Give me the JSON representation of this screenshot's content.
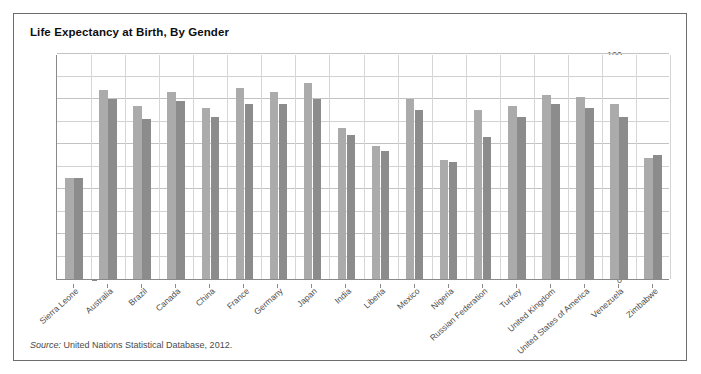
{
  "page": {
    "top_remnant_text": "·········· ····  ·······   ····"
  },
  "figure": {
    "title": "Life Expectancy at Birth, By Gender",
    "source_prefix": "Source:",
    "source_text": "United Nations Statistical Database, 2012."
  },
  "colors": {
    "female_bar": "#ababab",
    "male_bar": "#8c8c8c",
    "border": "#6d6d6d",
    "axis": "#8a8a8a",
    "gridline": "#d2d2d2",
    "title_text": "#0e0e0e",
    "tick_text": "#5a5a5a",
    "label_text": "#4d4d4d"
  },
  "chart_data": {
    "type": "bar",
    "title": "Life Expectancy at Birth, By Gender",
    "xlabel": "",
    "ylabel": "",
    "ylim": [
      0,
      100
    ],
    "ytick_values": [
      0,
      20,
      40,
      60,
      80,
      100
    ],
    "ytick_labels": [
      "0",
      "20",
      "40",
      "60",
      "80",
      "100"
    ],
    "yminor_values": [
      10,
      30,
      50,
      70,
      90
    ],
    "grid": true,
    "grid_axis": "both",
    "legend": false,
    "legend_position": "none",
    "categories": [
      "Sierra Leone",
      "Australia",
      "Brazil",
      "Canada",
      "China",
      "France",
      "Germany",
      "Japan",
      "India",
      "Liberia",
      "Mexico",
      "Nigeria",
      "Russian Federation",
      "Turkey",
      "United Kingdom",
      "United States of America",
      "Venezuela",
      "Zimbabwe"
    ],
    "series": [
      {
        "name": "Female",
        "color": "#ababab",
        "values": [
          45,
          84,
          77,
          83,
          76,
          85,
          83,
          87,
          67,
          59,
          80,
          53,
          75,
          77,
          82,
          81,
          78,
          54
        ]
      },
      {
        "name": "Male",
        "color": "#8c8c8c",
        "values": [
          45,
          80,
          71,
          79,
          72,
          78,
          78,
          80,
          64,
          57,
          75,
          52,
          63,
          72,
          78,
          76,
          72,
          55
        ]
      }
    ]
  }
}
